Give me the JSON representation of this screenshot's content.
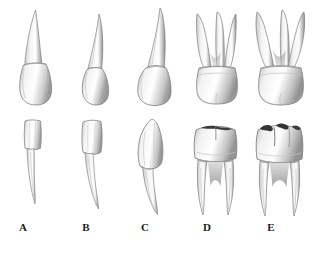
{
  "figure": {
    "background_color": "#ffffff",
    "ink_color": "#1c1c1c",
    "enamel_color": "#fdfdfd",
    "shadow_color": "#8d8d8d",
    "fissure_color": "#2b2b2b",
    "rows": 2,
    "columns": 5,
    "width": 331,
    "height": 255
  },
  "labels": [
    {
      "key": "A",
      "text": "A",
      "x": 23
    },
    {
      "key": "B",
      "text": "B",
      "x": 86
    },
    {
      "key": "C",
      "text": "C",
      "x": 145
    },
    {
      "key": "D",
      "text": "D",
      "x": 207
    },
    {
      "key": "E",
      "text": "E",
      "x": 271
    }
  ],
  "upper_row": {
    "name": "upper-teeth-row",
    "teeth": [
      {
        "id": "upper-a",
        "label": "A",
        "type": "central-incisor",
        "arch": "upper",
        "roots": 1,
        "x": 8,
        "y": 8,
        "w": 58,
        "h": 100
      },
      {
        "id": "upper-b",
        "label": "B",
        "type": "lateral-incisor",
        "arch": "upper",
        "roots": 1,
        "x": 68,
        "y": 12,
        "w": 54,
        "h": 96
      },
      {
        "id": "upper-c",
        "label": "C",
        "type": "canine",
        "arch": "upper",
        "roots": 1,
        "x": 126,
        "y": 6,
        "w": 58,
        "h": 104
      },
      {
        "id": "upper-d",
        "label": "D",
        "type": "first-molar",
        "arch": "upper",
        "roots": 3,
        "x": 186,
        "y": 8,
        "w": 62,
        "h": 100
      },
      {
        "id": "upper-e",
        "label": "E",
        "type": "second-molar",
        "arch": "upper",
        "roots": 3,
        "x": 248,
        "y": 4,
        "w": 66,
        "h": 104
      }
    ]
  },
  "lower_row": {
    "name": "lower-teeth-row",
    "teeth": [
      {
        "id": "lower-a",
        "label": "A",
        "type": "central-incisor",
        "arch": "lower",
        "roots": 1,
        "x": 12,
        "y": 118,
        "w": 48,
        "h": 96
      },
      {
        "id": "lower-b",
        "label": "B",
        "type": "lateral-incisor",
        "arch": "lower",
        "roots": 1,
        "x": 70,
        "y": 118,
        "w": 52,
        "h": 98
      },
      {
        "id": "lower-c",
        "label": "C",
        "type": "canine",
        "arch": "lower",
        "roots": 1,
        "x": 126,
        "y": 116,
        "w": 56,
        "h": 102
      },
      {
        "id": "lower-d",
        "label": "D",
        "type": "first-molar",
        "arch": "lower",
        "roots": 2,
        "x": 186,
        "y": 116,
        "w": 60,
        "h": 102
      },
      {
        "id": "lower-e",
        "label": "E",
        "type": "second-molar",
        "arch": "lower",
        "roots": 2,
        "x": 248,
        "y": 114,
        "w": 64,
        "h": 104
      }
    ]
  }
}
